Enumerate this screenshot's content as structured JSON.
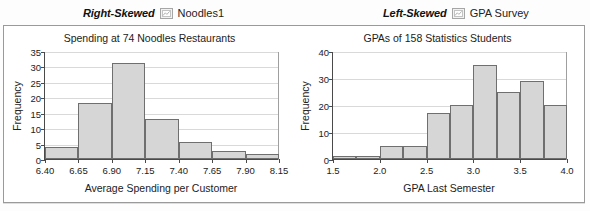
{
  "panels": [
    {
      "skew_label": "Right-Skewed",
      "dataset_name": "Noodles1",
      "icon": "dataset-icon"
    },
    {
      "skew_label": "Left-Skewed",
      "dataset_name": "GPA Survey",
      "icon": "dataset-icon"
    }
  ],
  "chart_data": [
    {
      "type": "bar",
      "title": "Spending at 74 Noodles Restaurants",
      "xlabel": "Average Spending per Customer",
      "ylabel": "Frequency",
      "xlim": [
        6.4,
        8.15
      ],
      "ylim": [
        0,
        35
      ],
      "ytick_values": [
        0,
        5,
        10,
        15,
        20,
        25,
        30,
        35
      ],
      "ytick_labels": [
        "0",
        "5",
        "10",
        "15",
        "20",
        "25",
        "30",
        "35"
      ],
      "xtick_values": [
        6.4,
        6.65,
        6.9,
        7.15,
        7.4,
        7.65,
        7.9,
        8.15
      ],
      "xtick_labels": [
        "6.40",
        "6.65",
        "6.90",
        "7.15",
        "7.40",
        "7.65",
        "7.90",
        "8.15"
      ],
      "bin_width": 0.25,
      "bin_edges": [
        6.4,
        6.65,
        6.9,
        7.15,
        7.4,
        7.65,
        7.9,
        8.15
      ],
      "values": [
        4,
        18,
        31,
        13,
        5.5,
        2.5,
        1.5
      ],
      "grid": true,
      "legend": "none",
      "bar_fill": "#d6d6d6",
      "bar_stroke": "#6f6f6f"
    },
    {
      "type": "bar",
      "title": "GPAs of 158 Statistics Students",
      "xlabel": "GPA Last Semester",
      "ylabel": "Frequency",
      "xlim": [
        1.5,
        4.0
      ],
      "ylim": [
        0,
        40
      ],
      "ytick_values": [
        0,
        10,
        20,
        30,
        40
      ],
      "ytick_labels": [
        "0",
        "10",
        "20",
        "30",
        "40"
      ],
      "xtick_values": [
        1.5,
        2.0,
        2.5,
        3.0,
        3.5,
        4.0
      ],
      "xtick_labels": [
        "1.5",
        "2.0",
        "2.5",
        "3.0",
        "3.5",
        "4.0"
      ],
      "bin_width": 0.25,
      "bin_edges": [
        1.5,
        1.75,
        2.0,
        2.25,
        2.5,
        2.75,
        3.0,
        3.25,
        3.5,
        3.75,
        4.0
      ],
      "values": [
        1,
        1,
        5,
        5,
        17,
        20,
        35,
        25,
        29,
        20
      ],
      "grid": true,
      "legend": "none",
      "bar_fill": "#d6d6d6",
      "bar_stroke": "#6f6f6f"
    }
  ]
}
